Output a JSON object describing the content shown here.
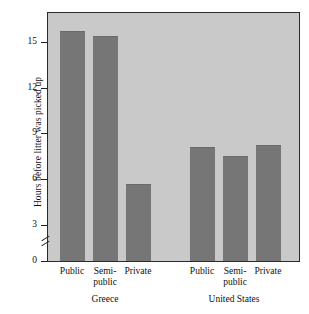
{
  "chart_data": {
    "type": "bar",
    "title": "",
    "xlabel": "",
    "ylabel": "Hours before litter was picked up",
    "ylim": [
      0,
      16.5
    ],
    "yticks": [
      0,
      3,
      6,
      9,
      12,
      15
    ],
    "ytick_labels": [
      "0",
      "3",
      "6",
      "9",
      "12",
      "15"
    ],
    "axis_break": {
      "present": true,
      "between": [
        0,
        3
      ],
      "symbol": "double-slash"
    },
    "grid": false,
    "legend": false,
    "bar_color": "#767676",
    "panel_color": "#c9c9c9",
    "frame_color": "#2b2b2b",
    "groups": [
      {
        "name": "Greece",
        "categories": [
          "Public",
          "Semi-public",
          "Private"
        ],
        "values": [
          15.3,
          15.0,
          5.1
        ]
      },
      {
        "name": "United States",
        "categories": [
          "Public",
          "Semi-public",
          "Private"
        ],
        "values": [
          7.6,
          7.0,
          7.7
        ]
      }
    ],
    "categories": [
      "Public",
      "Semi-public",
      "Private",
      "Public",
      "Semi-public",
      "Private"
    ],
    "values": [
      15.3,
      15.0,
      5.1,
      7.6,
      7.0,
      7.7
    ]
  },
  "axis": {
    "y_title": "Hours before litter was picked up",
    "tick_0": "0",
    "tick_3": "3",
    "tick_6": "6",
    "tick_9": "9",
    "tick_12": "12",
    "tick_15": "15"
  },
  "categories": {
    "greece": {
      "public": "Public",
      "semi_line1": "Semi-",
      "semi_line2": "public",
      "private": "Private",
      "group": "Greece"
    },
    "us": {
      "public": "Public",
      "semi_line1": "Semi-",
      "semi_line2": "public",
      "private": "Private",
      "group": "United States"
    }
  }
}
